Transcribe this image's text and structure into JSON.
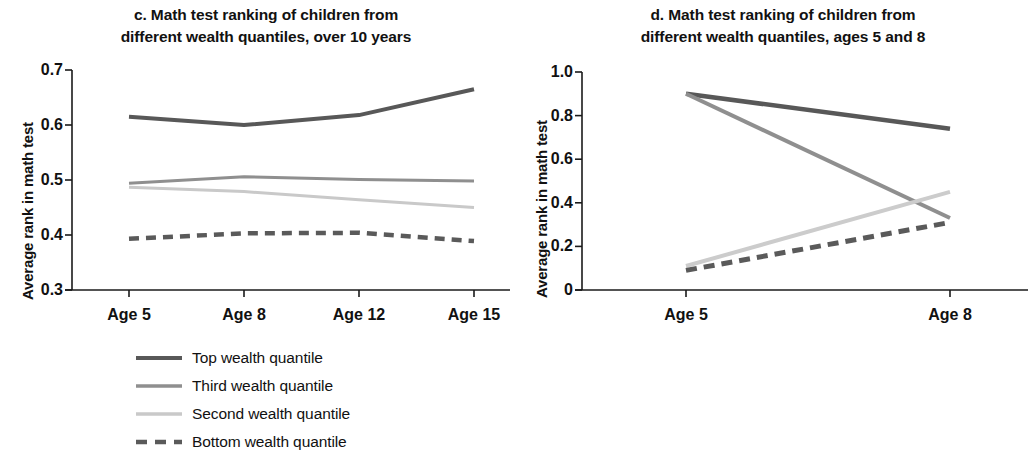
{
  "figure": {
    "panels": [
      {
        "key": "c",
        "title_line1": "c. Math test ranking of children from",
        "title_line2": "different wealth quantiles, over 10 years",
        "ylabel": "Average rank in math test"
      },
      {
        "key": "d",
        "title_line1": "d. Math test ranking of children from",
        "title_line2": "different wealth quantiles, ages 5 and 8",
        "ylabel": "Average rank in math test"
      }
    ]
  },
  "chart_data": [
    {
      "type": "line",
      "panel": "c",
      "title": "c. Math test ranking of children from different wealth quantiles, over 10 years",
      "xlabel": "",
      "ylabel": "Average rank in math test",
      "categories": [
        "Age 5",
        "Age 8",
        "Age 12",
        "Age 15"
      ],
      "ylim": [
        0.3,
        0.7
      ],
      "yticks": [
        "0.3",
        "0.4",
        "0.5",
        "0.6",
        "0.7"
      ],
      "ytick_values": [
        0.3,
        0.4,
        0.5,
        0.6,
        0.7
      ],
      "grid": false,
      "legend_position": "below",
      "series": [
        {
          "name": "Top wealth quantile",
          "values": [
            0.615,
            0.6,
            0.618,
            0.665
          ],
          "color": "#585858",
          "style": "solid",
          "width": 4
        },
        {
          "name": "Third wealth quantile",
          "values": [
            0.494,
            0.506,
            0.501,
            0.498
          ],
          "color": "#8f8f8f",
          "style": "solid",
          "width": 3
        },
        {
          "name": "Second wealth quantile",
          "values": [
            0.487,
            0.479,
            0.464,
            0.45
          ],
          "color": "#c9c9c9",
          "style": "solid",
          "width": 3
        },
        {
          "name": "Bottom wealth quantile",
          "values": [
            0.393,
            0.403,
            0.404,
            0.389
          ],
          "color": "#5a5a5a",
          "style": "dashed",
          "width": 4.5
        }
      ]
    },
    {
      "type": "line",
      "panel": "d",
      "title": "d. Math test ranking of children from different wealth quantiles, ages 5 and 8",
      "xlabel": "",
      "ylabel": "Average rank in math test",
      "categories": [
        "Age 5",
        "Age 8"
      ],
      "ylim": [
        0,
        1.0
      ],
      "yticks": [
        "0",
        "0.2",
        "0.4",
        "0.6",
        "0.8",
        "1.0"
      ],
      "ytick_values": [
        0,
        0.2,
        0.4,
        0.6,
        0.8,
        1.0
      ],
      "grid": false,
      "legend_position": "below",
      "series": [
        {
          "name": "Better-off children with high test scores (n = 126)",
          "name_prefix": "Better-off children with high test scores (",
          "name_italic": "n",
          "name_suffix": " = 126)",
          "values": [
            0.9,
            0.74
          ],
          "color": "#585858",
          "style": "solid",
          "width": 4.5
        },
        {
          "name": "Poorer children with high test scores (n = 44)",
          "name_prefix": "Poorer children with high test scores (",
          "name_italic": "n",
          "name_suffix": " = 44)",
          "values": [
            0.9,
            0.33
          ],
          "color": "#8f8f8f",
          "style": "solid",
          "width": 4,
          "n": 44
        },
        {
          "name": "Better-off children with low test scores (n = 44)",
          "name_prefix": "Better-off children with low test scores (",
          "name_italic": "n",
          "name_suffix": " = 44)",
          "values": [
            0.11,
            0.45
          ],
          "color": "#cccccc",
          "style": "solid",
          "width": 4
        },
        {
          "name": "Poorer children with low test scores (n = 108)",
          "name_prefix": "Poorer children with low test scores (",
          "name_italic": "n",
          "name_suffix": " = 108)",
          "values": [
            0.09,
            0.31
          ],
          "color": "#5a5a5a",
          "style": "dashed",
          "width": 5
        }
      ]
    }
  ],
  "axis_color": "#1a1a1a"
}
